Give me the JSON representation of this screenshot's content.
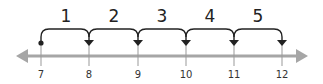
{
  "number_line": {
    "axis_color": "#a6a6a6",
    "arc_color": "#222222",
    "ticks": [
      {
        "value": "7",
        "x": 41
      },
      {
        "value": "8",
        "x": 89
      },
      {
        "value": "9",
        "x": 138
      },
      {
        "value": "10",
        "x": 186
      },
      {
        "value": "11",
        "x": 234
      },
      {
        "value": "12",
        "x": 282
      }
    ],
    "start_value": "7",
    "jumps": [
      {
        "label": "1",
        "from": "7",
        "to": "8"
      },
      {
        "label": "2",
        "from": "8",
        "to": "9"
      },
      {
        "label": "3",
        "from": "9",
        "to": "10"
      },
      {
        "label": "4",
        "from": "10",
        "to": "11"
      },
      {
        "label": "5",
        "from": "11",
        "to": "12"
      }
    ]
  }
}
